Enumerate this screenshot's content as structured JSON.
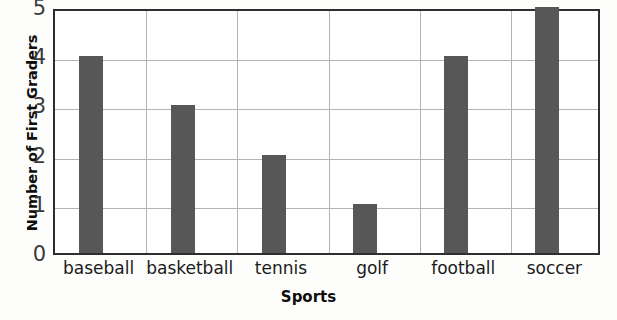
{
  "chart_data": {
    "type": "bar",
    "title": "",
    "xlabel": "Sports",
    "ylabel": "Number of First Graders",
    "categories": [
      "baseball",
      "basketball",
      "tennis",
      "golf",
      "football",
      "soccer"
    ],
    "values": [
      4,
      3,
      2,
      1,
      4,
      5
    ],
    "ylim": [
      0,
      5
    ],
    "ytick_labels": [
      "5",
      "4",
      "3",
      "2",
      "1",
      "0"
    ],
    "grid": "both",
    "legend": "none",
    "bar_color": "#575757",
    "frame_color": "#2e2e2e",
    "grid_color": "#b4b4b4",
    "background_color": "#fdfdfc"
  },
  "axes": {
    "y_title": "Number of First Graders",
    "x_title": "Sports"
  }
}
